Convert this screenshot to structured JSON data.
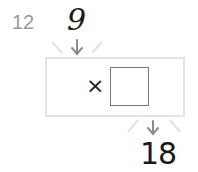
{
  "problem": {
    "number": "12",
    "input_value": "9",
    "operator": "×",
    "answer": "",
    "output_value": "18"
  },
  "colors": {
    "machine_outline": "#e4e4e4",
    "arrow": "#8c8c8c",
    "number_label": "#9a9a9a"
  },
  "icons": {
    "in_arrow": "down-arrow",
    "out_arrow": "down-arrow"
  }
}
